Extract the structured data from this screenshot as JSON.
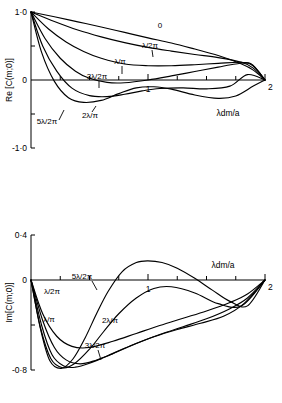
{
  "figure": {
    "panels": [
      {
        "id": "re",
        "ylabel": "Re [C(m;0)]",
        "xlabel": "λdm/a",
        "ytick_labels": [
          "1·0",
          "0",
          "-1·0"
        ],
        "xtick_labels": [
          "1",
          "2"
        ],
        "curve_labels": [
          "0",
          "λ/2π",
          "λ/π",
          "3λ/2π",
          "2λ/π",
          "5λ/2π"
        ]
      },
      {
        "id": "im",
        "ylabel": "Im[C(m;0)]",
        "xlabel": "λdm/a",
        "ytick_labels": [
          "0·4",
          "0",
          "-0·8"
        ],
        "xtick_labels": [
          "1",
          "2"
        ],
        "curve_labels": [
          "5λ/2π",
          "λ/2π",
          "λ/π",
          "2λ/π",
          "3λ/2π"
        ]
      }
    ]
  },
  "chart_data": [
    {
      "type": "line",
      "title": "",
      "xlabel": "λdm/a",
      "ylabel": "Re [C(m;0)]",
      "xlim": [
        0,
        2
      ],
      "ylim": [
        -1.0,
        1.0
      ],
      "xticks": [
        0,
        0.25,
        0.5,
        0.75,
        1,
        1.25,
        1.5,
        1.75,
        2
      ],
      "xtick_labels": {
        "0": "0",
        "1": "1",
        "2": "2"
      },
      "yticks": [
        -1.0,
        -0.5,
        0,
        0.5,
        1.0
      ],
      "ytick_labels": {
        "1": "1·0",
        "0": "0",
        "-1": "-1·0"
      },
      "grid": false,
      "legend": "inline-labels",
      "series": [
        {
          "name": "0",
          "label": "0",
          "x": [
            0,
            0.2,
            0.4,
            0.6,
            0.8,
            1.0,
            1.2,
            1.4,
            1.6,
            1.8,
            1.9,
            2.0
          ],
          "values": [
            1.0,
            0.93,
            0.855,
            0.78,
            0.7,
            0.62,
            0.545,
            0.455,
            0.36,
            0.235,
            0.145,
            0.0
          ]
        },
        {
          "name": "lambda/2pi",
          "label": "λ/2π",
          "x": [
            0,
            0.2,
            0.4,
            0.6,
            0.8,
            1.0,
            1.2,
            1.4,
            1.6,
            1.8,
            1.9,
            2.0
          ],
          "values": [
            1.0,
            0.86,
            0.735,
            0.635,
            0.55,
            0.48,
            0.425,
            0.375,
            0.33,
            0.26,
            0.175,
            0.0
          ]
        },
        {
          "name": "lambda/pi",
          "label": "λ/π",
          "x": [
            0,
            0.15,
            0.3,
            0.45,
            0.6,
            0.8,
            1.0,
            1.2,
            1.4,
            1.6,
            1.8,
            1.9,
            2.0
          ],
          "values": [
            1.0,
            0.75,
            0.56,
            0.42,
            0.32,
            0.235,
            0.21,
            0.21,
            0.225,
            0.245,
            0.26,
            0.205,
            0.0
          ]
        },
        {
          "name": "3lambda/2pi",
          "label": "3λ/2π",
          "x": [
            0,
            0.12,
            0.25,
            0.38,
            0.5,
            0.65,
            0.8,
            1.0,
            1.2,
            1.4,
            1.6,
            1.75,
            1.88,
            2.0
          ],
          "values": [
            1.0,
            0.61,
            0.32,
            0.13,
            0.025,
            -0.035,
            -0.04,
            0.0,
            0.06,
            0.125,
            0.19,
            0.235,
            0.24,
            0.0
          ]
        },
        {
          "name": "2lambda/pi",
          "label": "2λ/π",
          "x": [
            0,
            0.1,
            0.22,
            0.35,
            0.5,
            0.65,
            0.8,
            0.95,
            1.1,
            1.3,
            1.5,
            1.7,
            1.85,
            2.0
          ],
          "values": [
            1.0,
            0.5,
            0.13,
            -0.12,
            -0.23,
            -0.245,
            -0.21,
            -0.16,
            -0.125,
            -0.115,
            -0.13,
            -0.09,
            0.08,
            0.0
          ]
        },
        {
          "name": "5lambda/2pi",
          "label": "5λ/2π",
          "x": [
            0,
            0.09,
            0.2,
            0.32,
            0.45,
            0.6,
            0.75,
            0.9,
            1.05,
            1.2,
            1.4,
            1.6,
            1.75,
            1.9,
            2.0
          ],
          "values": [
            1.0,
            0.41,
            -0.02,
            -0.26,
            -0.33,
            -0.3,
            -0.2,
            -0.115,
            -0.1,
            -0.135,
            -0.22,
            -0.27,
            -0.235,
            -0.09,
            0.0
          ]
        }
      ]
    },
    {
      "type": "line",
      "title": "",
      "xlabel": "λdm/a",
      "ylabel": "Im[C(m;0)]",
      "xlim": [
        0,
        2
      ],
      "ylim": [
        -0.8,
        0.4
      ],
      "xticks": [
        0,
        0.25,
        0.5,
        0.75,
        1,
        1.25,
        1.5,
        1.75,
        2
      ],
      "xtick_labels": {
        "0": "0",
        "1": "1",
        "2": "2"
      },
      "yticks": [
        -0.8,
        -0.4,
        0,
        0.4
      ],
      "ytick_labels": {
        "0.4": "0·4",
        "0": "0",
        "-0.8": "-0·8"
      },
      "grid": false,
      "legend": "inline-labels",
      "series": [
        {
          "name": "lambda/2pi",
          "label": "λ/2π",
          "x": [
            0,
            0.1,
            0.22,
            0.35,
            0.5,
            0.7,
            0.9,
            1.1,
            1.3,
            1.5,
            1.7,
            1.85,
            2.0
          ],
          "values": [
            0.0,
            -0.3,
            -0.5,
            -0.59,
            -0.6,
            -0.545,
            -0.475,
            -0.405,
            -0.34,
            -0.275,
            -0.2,
            -0.125,
            0.0
          ]
        },
        {
          "name": "lambda/pi",
          "label": "λ/π",
          "x": [
            0,
            0.1,
            0.2,
            0.3,
            0.42,
            0.55,
            0.7,
            0.9,
            1.1,
            1.3,
            1.5,
            1.7,
            1.85,
            2.0
          ],
          "values": [
            0.0,
            -0.36,
            -0.6,
            -0.71,
            -0.745,
            -0.715,
            -0.655,
            -0.565,
            -0.485,
            -0.415,
            -0.345,
            -0.255,
            -0.16,
            0.0
          ]
        },
        {
          "name": "3lambda/2pi",
          "label": "3λ/2π",
          "x": [
            0,
            0.09,
            0.18,
            0.28,
            0.38,
            0.5,
            0.65,
            0.85,
            1.05,
            1.25,
            1.45,
            1.65,
            1.82,
            2.0
          ],
          "values": [
            0.0,
            -0.4,
            -0.665,
            -0.765,
            -0.775,
            -0.74,
            -0.675,
            -0.585,
            -0.505,
            -0.44,
            -0.385,
            -0.32,
            -0.21,
            0.0
          ]
        },
        {
          "name": "2lambda/pi",
          "label": "2λ/π",
          "x": [
            0,
            0.08,
            0.17,
            0.27,
            0.37,
            0.5,
            0.62,
            0.75,
            0.9,
            1.05,
            1.2,
            1.4,
            1.6,
            1.8,
            2.0
          ],
          "values": [
            0.0,
            -0.42,
            -0.7,
            -0.78,
            -0.745,
            -0.615,
            -0.46,
            -0.3,
            -0.16,
            -0.075,
            -0.06,
            -0.115,
            -0.21,
            -0.23,
            0.0
          ]
        },
        {
          "name": "5lambda/2pi",
          "label": "5λ/2π",
          "x": [
            0,
            0.08,
            0.16,
            0.26,
            0.36,
            0.46,
            0.56,
            0.66,
            0.78,
            0.9,
            1.0,
            1.12,
            1.25,
            1.4,
            1.55,
            1.7,
            1.85,
            2.0
          ],
          "values": [
            0.0,
            -0.43,
            -0.715,
            -0.785,
            -0.7,
            -0.52,
            -0.3,
            -0.1,
            0.075,
            0.155,
            0.17,
            0.155,
            0.105,
            0.015,
            -0.09,
            -0.19,
            -0.23,
            0.0
          ]
        }
      ]
    }
  ]
}
